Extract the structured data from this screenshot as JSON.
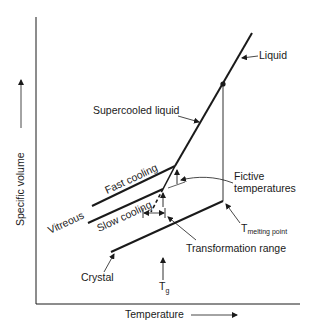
{
  "diagram": {
    "axes": {
      "x_label": "Temperature",
      "y_label": "Specific volume"
    },
    "curves": [
      {
        "id": "liquid",
        "label": "Liquid"
      },
      {
        "id": "supercooled-liquid",
        "label": "Supercooled liquid"
      },
      {
        "id": "fast-cooling",
        "label": "Fast cooling"
      },
      {
        "id": "slow-cooling",
        "label": "Slow cooling"
      },
      {
        "id": "crystal",
        "label": "Crystal"
      }
    ],
    "annotations": {
      "vitreous": "Vitreous",
      "fictive_line1": "Fictive",
      "fictive_line2": "temperatures",
      "melting_T": "T",
      "melting_sub": "melting point",
      "transformation_range": "Transformation range",
      "tg_T": "T",
      "tg_sub": "g"
    },
    "colors": {
      "ink": "#1a1a1a",
      "background": "#ffffff"
    }
  }
}
